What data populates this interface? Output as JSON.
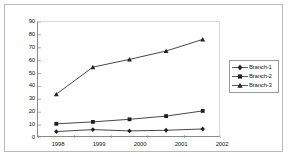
{
  "chart_data": {
    "type": "line",
    "title": "",
    "xlabel": "",
    "ylabel": "",
    "categories": [
      "1998",
      "1999",
      "2000",
      "2001",
      "2002"
    ],
    "ylim": [
      0,
      90
    ],
    "yticks": [
      "90",
      "80",
      "70",
      "60",
      "50",
      "40",
      "30",
      "20",
      "10",
      "0"
    ],
    "ytick_values": [
      90,
      80,
      70,
      60,
      50,
      40,
      30,
      20,
      10,
      0
    ],
    "grid": false,
    "legend_position": "right",
    "series": [
      {
        "name": "Branch-1",
        "marker": "diamond",
        "color": "#333333",
        "values": [
          5,
          6.5,
          5.5,
          6,
          7
        ]
      },
      {
        "name": "Branch-2",
        "marker": "square",
        "color": "#333333",
        "values": [
          11,
          12.5,
          14.5,
          17,
          21
        ]
      },
      {
        "name": "Branch-3",
        "marker": "triangle",
        "color": "#333333",
        "values": [
          34,
          55,
          61,
          67.5,
          76.5
        ]
      }
    ]
  },
  "legend": {
    "items": [
      {
        "label": "Branch-1",
        "marker": "diamond"
      },
      {
        "label": "Branch-2",
        "marker": "square"
      },
      {
        "label": "Branch-3",
        "marker": "triangle"
      }
    ]
  },
  "colors": {
    "frame_border": "#b8b8b8",
    "axis": "#8a8a8a",
    "series_line": "#333333",
    "background": "#ffffff"
  }
}
